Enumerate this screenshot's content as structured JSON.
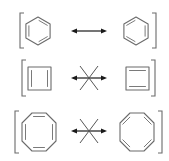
{
  "title": "Resonance structures of cyclic conjugated polyenes",
  "colors": {
    "bond": "#6b6b6b",
    "arrow": "#1a1a1a",
    "background": "#ffffff"
  },
  "rows": [
    {
      "molecule": "benzene",
      "ring_size": 6,
      "relation": "resonance",
      "arrow_symbol": "double-headed-arrow",
      "left_structure": "Kekulé structure A",
      "right_structure": "Kekulé structure B"
    },
    {
      "molecule": "cyclobutadiene",
      "ring_size": 4,
      "relation": "not resonance",
      "arrow_symbol": "crossed-double-headed-arrow",
      "left_structure": "vertical double bonds",
      "right_structure": "horizontal double bonds"
    },
    {
      "molecule": "cyclooctatetraene",
      "ring_size": 8,
      "relation": "not resonance",
      "arrow_symbol": "crossed-double-headed-arrow",
      "left_structure": "bond-alternation isomer A",
      "right_structure": "bond-alternation isomer B"
    }
  ]
}
